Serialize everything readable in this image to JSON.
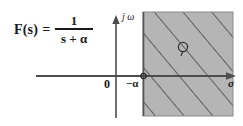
{
  "figure": {
    "formula": {
      "lhs": "F(s)",
      "equals": "=",
      "numerator": "1",
      "denominator": "s + α"
    },
    "axes": {
      "vertical_label": "j ω",
      "horizontal_label": "σ",
      "origin_label": "0",
      "pole_label": "−α"
    },
    "markers": {
      "pole_symbol": "pole-circle"
    },
    "colors": {
      "background": "#ffffff",
      "ink": "#1a1a1a",
      "shaded_region": "#b5b5b5",
      "hatch_line": "#4a4a4a",
      "region_border": "#6e6e6e"
    },
    "geometry": {
      "vertical_axis_x": 116,
      "horizontal_axis_y": 76,
      "region_left": 143,
      "region_right": 233,
      "region_top": 12,
      "region_bottom": 116,
      "pole_x": 143,
      "pole_y": 76,
      "marker_x": 183,
      "marker_y": 48
    }
  }
}
